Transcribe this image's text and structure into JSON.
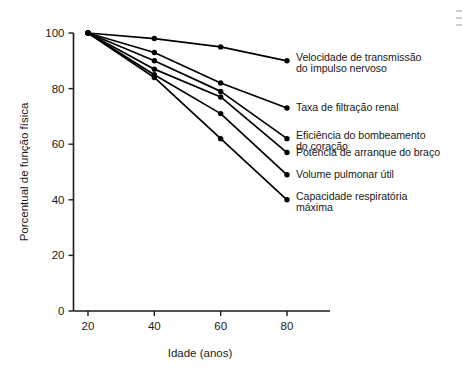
{
  "chart_data": {
    "type": "line",
    "title": "",
    "xlabel": "Idade (anos)",
    "ylabel": "Porcentual de função física",
    "x": [
      20,
      40,
      60,
      80
    ],
    "xlim": [
      10,
      90
    ],
    "ylim": [
      0,
      100
    ],
    "xticks": [
      "20",
      "40",
      "60",
      "80"
    ],
    "yticks": [
      "0",
      "20",
      "40",
      "60",
      "80",
      "100"
    ],
    "grid": false,
    "legend_position": "right-inline-labels",
    "marker": "filled-circle",
    "line_color": "#000000",
    "series": [
      {
        "name": "Velocidade de transmissão do impulso nervoso",
        "label_lines": "Velocidade de transmissão\ndo impulso nervoso",
        "values": [
          100,
          98,
          95,
          90
        ]
      },
      {
        "name": "Taxa de filtração renal",
        "label_lines": "Taxa de filtração renal",
        "values": [
          100,
          93,
          82,
          73
        ]
      },
      {
        "name": "Eficiência do bombeamento do coração",
        "label_lines": "Eficiência do bombeamento\ndo coração",
        "values": [
          100,
          90,
          79,
          62
        ]
      },
      {
        "name": "Potência de arranque do braço",
        "label_lines": "Potência de arranque do braço",
        "values": [
          100,
          87,
          77,
          57
        ]
      },
      {
        "name": "Volume pulmonar útil",
        "label_lines": "Volume pulmonar útil",
        "values": [
          100,
          85,
          71,
          49
        ]
      },
      {
        "name": "Capacidade respiratória máxima",
        "label_lines": "Capacidade respiratória\nmáxima",
        "values": [
          100,
          84,
          62,
          40
        ]
      }
    ]
  }
}
